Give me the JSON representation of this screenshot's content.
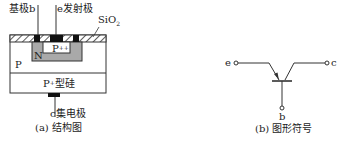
{
  "structure": {
    "base_label": "基极b",
    "emitter_label": "e发射极",
    "oxide_label": "SiO",
    "oxide_sub": "2",
    "n_region_label": "N",
    "p_pp_label": "P",
    "p_pp_sup": "++",
    "p_region_label": "P",
    "substrate_label_main": "P",
    "substrate_label_sup": "+",
    "substrate_label_rest": "型硅",
    "collector_label": "c集电极",
    "caption": "(a) 结构图"
  },
  "symbol": {
    "emitter_terminal": "e",
    "collector_terminal": "c",
    "base_terminal": "b",
    "caption": "(b) 图形符号"
  },
  "colors": {
    "line": "#333333",
    "n_region_fill": "#a9a9a9",
    "contact_fill": "#111111",
    "background": "#ffffff"
  }
}
